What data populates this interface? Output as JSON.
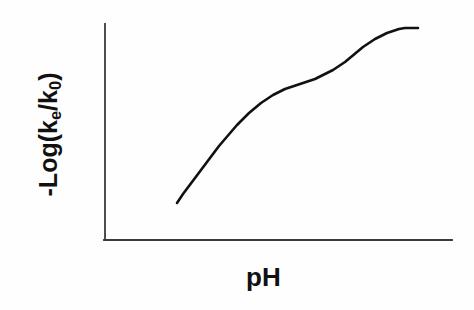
{
  "figure": {
    "background_color": "#fefefe",
    "ink_color": "#111111"
  },
  "axes": {
    "y_axis_name": "y-axis-line",
    "x_axis_name": "x-axis-line",
    "y_label_prefix": "-Log(k",
    "y_label_sub1": "e",
    "y_label_mid": "/k",
    "y_label_sub2": "0",
    "y_label_suffix": ")",
    "y_label_plain": "-Log(ke/k0)",
    "x_label": "pH"
  },
  "chart_data": {
    "type": "line",
    "title": "",
    "subtitle": "",
    "xlabel": "pH",
    "ylabel": "-Log(ke/k0)",
    "legend": [],
    "legend_position": "none",
    "grid": false,
    "axis_ticks": false,
    "axis_tick_labels": false,
    "xlim": [
      0,
      10
    ],
    "ylim": [
      0,
      10
    ],
    "line_color": "#111111",
    "line_width_px": 2.6,
    "series": [
      {
        "name": "pH-rate profile",
        "x": [
          2.35,
          2.7,
          3.05,
          3.4,
          3.75,
          4.05,
          4.35,
          4.6,
          4.85,
          5.1,
          5.4,
          5.7,
          6.0,
          6.3,
          6.6,
          6.9,
          7.2,
          7.5,
          7.8,
          8.1,
          8.4,
          8.7,
          9.0,
          9.3,
          9.55,
          9.75
        ],
        "y": [
          1.3,
          1.85,
          2.35,
          2.9,
          3.45,
          4.0,
          4.55,
          5.0,
          5.35,
          5.65,
          5.9,
          6.1,
          6.28,
          6.42,
          6.52,
          6.62,
          6.8,
          7.05,
          7.4,
          7.8,
          8.2,
          8.55,
          8.8,
          8.95,
          9.0,
          9.02
        ]
      }
    ],
    "pixel_path": {
      "note": "curve traced in screenshot pixel coordinates",
      "start": [
        177,
        203
      ],
      "end": [
        418,
        28
      ],
      "points": [
        [
          177,
          203
        ],
        [
          183,
          194
        ],
        [
          189,
          186
        ],
        [
          195,
          178
        ],
        [
          201,
          170
        ],
        [
          207,
          162
        ],
        [
          213,
          154
        ],
        [
          219,
          146
        ],
        [
          225,
          139
        ],
        [
          231,
          132
        ],
        [
          237,
          125
        ],
        [
          243,
          119
        ],
        [
          249,
          113
        ],
        [
          255,
          108
        ],
        [
          261,
          103
        ],
        [
          267,
          99
        ],
        [
          273,
          95
        ],
        [
          279,
          92
        ],
        [
          285,
          89
        ],
        [
          291,
          87
        ],
        [
          297,
          85
        ],
        [
          303,
          83
        ],
        [
          309,
          81
        ],
        [
          315,
          79
        ],
        [
          321,
          76
        ],
        [
          327,
          73
        ],
        [
          333,
          70
        ],
        [
          339,
          66
        ],
        [
          345,
          62
        ],
        [
          351,
          57
        ],
        [
          357,
          52
        ],
        [
          363,
          47
        ],
        [
          369,
          43
        ],
        [
          375,
          39
        ],
        [
          381,
          36
        ],
        [
          387,
          33
        ],
        [
          393,
          31
        ],
        [
          399,
          29
        ],
        [
          405,
          28
        ],
        [
          411,
          28
        ],
        [
          418,
          28
        ]
      ]
    }
  }
}
